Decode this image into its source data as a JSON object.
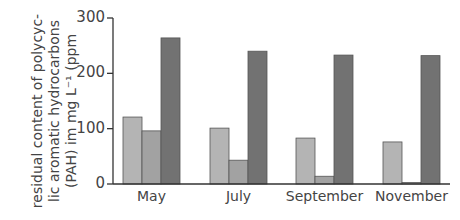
{
  "chart_data": {
    "type": "bar",
    "title": "",
    "xlabel": "",
    "ylabel": "residual content of polycyclic aromatic hydrocarbons (PAH) im mg L⁻¹ (ppm",
    "ylabel_lines": [
      "residual content of polycyc-",
      "lic aromatic hydrocarbons",
      "(PAH) im mg L⁻¹ (ppm"
    ],
    "ylim": [
      0,
      300
    ],
    "yticks": [
      0,
      100,
      200,
      300
    ],
    "categories": [
      "May",
      "July",
      "September",
      "November"
    ],
    "series": [
      {
        "name": "Series 1",
        "color": "#b4b4b4",
        "values": [
          121,
          101,
          83,
          76
        ]
      },
      {
        "name": "Series 2",
        "color": "#a2a2a2",
        "values": [
          96,
          43,
          14,
          2
        ]
      },
      {
        "name": "Series 3",
        "color": "#727272",
        "values": [
          264,
          240,
          233,
          232
        ]
      }
    ],
    "grid": false,
    "legend": "none"
  }
}
